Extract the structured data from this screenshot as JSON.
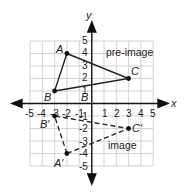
{
  "diagram": {
    "axes": {
      "x_label": "x",
      "y_label": "y",
      "x_ticks": [
        "-5",
        "-4",
        "-3",
        "-2",
        "-1",
        "1",
        "2",
        "3",
        "4",
        "5"
      ],
      "y_ticks": [
        "5",
        "4",
        "3",
        "2",
        "1",
        "-1",
        "-2",
        "-3",
        "-4",
        "-5"
      ],
      "range": [
        -5,
        5
      ]
    },
    "pre_image": {
      "label": "pre-image",
      "points": [
        {
          "name": "A",
          "x": -2,
          "y": 4
        },
        {
          "name": "B",
          "x": -3,
          "y": 1
        },
        {
          "name": "C",
          "x": 3,
          "y": 2
        }
      ]
    },
    "image": {
      "label": "image",
      "points": [
        {
          "name": "A′",
          "x": -2,
          "y": -4
        },
        {
          "name": "B′",
          "x": -3,
          "y": -1
        },
        {
          "name": "C′",
          "x": 3,
          "y": -2
        }
      ]
    },
    "extra_labels": {
      "b_near_axis": "B"
    },
    "colors": {
      "grid": "#c8c8c8",
      "axis": "#111111",
      "line": "#222222"
    }
  }
}
